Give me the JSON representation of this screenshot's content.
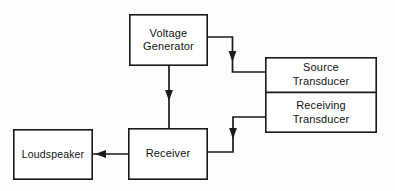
{
  "diagram": {
    "type": "block-diagram",
    "background_color": "#fdfdfd",
    "line_color": "#1a1a1a",
    "box_fill_color": "#ffffff",
    "blocks": [
      {
        "id": "voltage-generator",
        "label_lines": [
          "Voltage",
          "Generator"
        ],
        "line1": "Voltage",
        "line2": "Generator",
        "x": 129,
        "y": 14,
        "w": 79,
        "h": 52
      },
      {
        "id": "source-transducer",
        "label_lines": [
          "Source",
          "Transducer"
        ],
        "line1": "Source",
        "line2": "Transducer",
        "x": 265,
        "y": 57,
        "w": 112,
        "h": 35
      },
      {
        "id": "receiving-transducer",
        "label_lines": [
          "Receiving",
          "Transducer"
        ],
        "line1": "Receiving",
        "line2": "Transducer",
        "x": 265,
        "y": 92,
        "w": 112,
        "h": 41
      },
      {
        "id": "receiver",
        "label_lines": [
          "Receiver"
        ],
        "line1": "Receiver",
        "line2": "",
        "x": 128,
        "y": 128,
        "w": 80,
        "h": 52
      },
      {
        "id": "loudspeaker",
        "label_lines": [
          "Loudspeaker"
        ],
        "line1": "Loudspeaker",
        "line2": "",
        "x": 13,
        "y": 129,
        "w": 80,
        "h": 51
      }
    ],
    "connectors": [
      {
        "id": "voltage-generator-to-source-transducer",
        "from": "voltage-generator",
        "to": "source-transducer",
        "arrow_direction": "down",
        "path": "M 208 37 L 232.5 37 L 232.5 72 L 265 72"
      },
      {
        "id": "voltage-generator-to-receiver",
        "from": "voltage-generator",
        "to": "receiver",
        "arrow_direction": "down",
        "path": "M 169 66 L 169 128"
      },
      {
        "id": "receiving-transducer-to-receiver",
        "from": "receiving-transducer",
        "to": "receiver",
        "arrow_direction": "down",
        "path": "M 265 117 L 233 117 L 233 152 L 208 152"
      },
      {
        "id": "receiver-to-loudspeaker",
        "from": "receiver",
        "to": "loudspeaker",
        "arrow_direction": "left",
        "path": "M 128 154 L 93 154"
      }
    ]
  }
}
